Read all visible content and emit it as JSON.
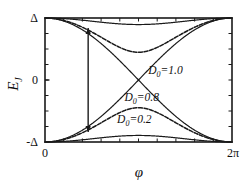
{
  "figure": {
    "background_color": "#ffffff",
    "line_color": "#1a1a1a",
    "axes": {
      "x": {
        "label": "φ",
        "tick_labels": [
          "0",
          "2π"
        ],
        "range_min": 0,
        "range_max": 6.2831853,
        "minor_ticks": 10
      },
      "y": {
        "label": "E",
        "label_subscript": "J",
        "tick_labels": [
          "Δ",
          "0",
          "-Δ"
        ],
        "range_min": -1,
        "range_max": 1,
        "minor_ticks": 8
      }
    },
    "annotations": [
      {
        "name": "gap-arrow",
        "type": "double-headed-vertical-arrow",
        "x": 1.45,
        "y_top": 0.84,
        "y_bottom": -0.84
      }
    ]
  },
  "chart_data": {
    "type": "line",
    "title": "",
    "xlabel": "φ",
    "ylabel": "E_J",
    "xlim": [
      0,
      6.2831853
    ],
    "ylim": [
      -1,
      1
    ],
    "xticks": [
      0,
      6.2831853
    ],
    "xticklabels": [
      "0",
      "2π"
    ],
    "yticks": [
      -1,
      0,
      1
    ],
    "yticklabels": [
      "-Δ",
      "0",
      "Δ"
    ],
    "grid": false,
    "legend": "inline-annotations",
    "formula": "E = ±Δ·sqrt(1 - D0·sin^2(φ/2))",
    "series": [
      {
        "name": "D0=0.2 upper",
        "label": "D₀=0.2",
        "D0": 0.2,
        "branch": "upper",
        "min_value": 0.894,
        "min_at_phi": 3.1416,
        "endpoint_value": 1.0
      },
      {
        "name": "D0=0.2 lower",
        "label": "D₀=0.2",
        "D0": 0.2,
        "branch": "lower",
        "min_value": -0.894,
        "min_at_phi": 3.1416,
        "endpoint_value": -1.0
      },
      {
        "name": "D0=0.8 upper",
        "label": "D₀=0.8",
        "D0": 0.8,
        "branch": "upper",
        "min_value": 0.447,
        "min_at_phi": 3.1416,
        "endpoint_value": 1.0
      },
      {
        "name": "D0=0.8 lower",
        "label": "D₀=0.8",
        "D0": 0.8,
        "branch": "lower",
        "min_value": -0.447,
        "min_at_phi": 3.1416,
        "endpoint_value": -1.0
      },
      {
        "name": "D0=1.0 upper",
        "label": "D₀=1.0",
        "D0": 1.0,
        "branch": "upper",
        "min_value": 0.0,
        "min_at_phi": 3.1416,
        "endpoint_value": 1.0
      },
      {
        "name": "D0=1.0 lower",
        "label": "D₀=1.0",
        "D0": 1.0,
        "branch": "lower",
        "min_value": 0.0,
        "min_at_phi": 3.1416,
        "endpoint_value": -1.0
      }
    ],
    "annotations": [
      {
        "text": "D₀=1.0",
        "base": "D",
        "sub": "0",
        "rest": "=1.0",
        "x": 4.05,
        "y": 0.1
      },
      {
        "text": "D₀=0.8",
        "base": "D",
        "sub": "0",
        "rest": "=0.8",
        "x": 3.25,
        "y": -0.34
      },
      {
        "text": "D₀=0.2",
        "base": "D",
        "sub": "0",
        "rest": "=0.2",
        "x": 3.0,
        "y": -0.7
      }
    ]
  }
}
